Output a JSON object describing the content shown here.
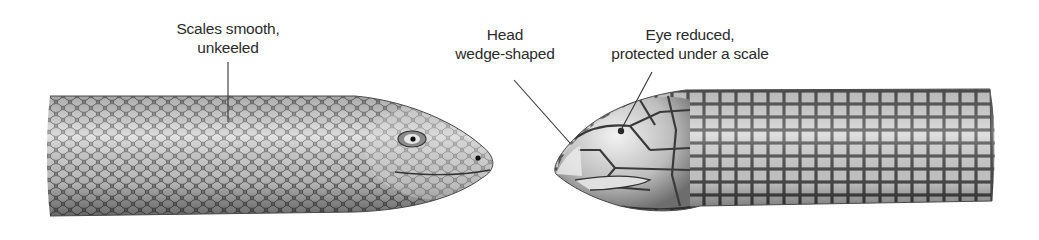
{
  "figure": {
    "left_specimen": {
      "label_lines": [
        "Scales smooth,",
        "unkeeled"
      ]
    },
    "right_specimen": {
      "labels": [
        {
          "id": "head",
          "lines": [
            "Head",
            "wedge-shaped"
          ]
        },
        {
          "id": "eye",
          "lines": [
            "Eye reduced,",
            "protected under a scale"
          ]
        }
      ]
    }
  },
  "colors": {
    "background": "#ffffff",
    "label_text": "#2b2b2b",
    "leader_line": "#333333",
    "scale_light": "#e6e6e6",
    "scale_mid": "#a8a8a8",
    "scale_dark": "#555555"
  }
}
